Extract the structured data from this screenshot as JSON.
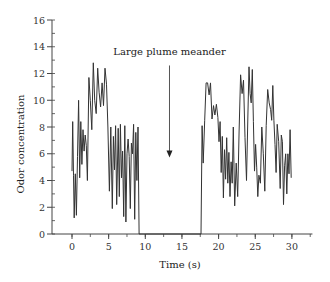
{
  "chart_data": {
    "type": "line",
    "title": "",
    "xlabel": "Time (s)",
    "ylabel": "Odor concentration",
    "xlim": [
      -2.8,
      32.8
    ],
    "ylim": [
      0,
      16
    ],
    "xticks": [
      0,
      5,
      10,
      15,
      20,
      25,
      30
    ],
    "xtick_labels": [
      "0",
      "5",
      "10",
      "15",
      "20",
      "25",
      "30"
    ],
    "x_minor_step": 2.5,
    "yticks": [
      0,
      2,
      4,
      6,
      8,
      10,
      12,
      14,
      16
    ],
    "ytick_labels": [
      "0",
      "2",
      "4",
      "6",
      "8",
      "10",
      "12",
      "14",
      "16"
    ],
    "y_minor_step": 1,
    "grid": false,
    "legend": null,
    "annotations": [
      {
        "text": "Large plume meander",
        "x": 13.3,
        "y": 13.5,
        "arrow_from": [
          13.3,
          12.6
        ],
        "arrow_to": [
          13.3,
          5.8
        ]
      }
    ],
    "series": [
      {
        "name": "Odor concentration",
        "color": "#333333",
        "x": [
          0.0,
          0.1,
          0.2,
          0.3,
          0.45,
          0.6,
          0.75,
          0.9,
          1.05,
          1.2,
          1.35,
          1.5,
          1.65,
          1.8,
          1.95,
          2.1,
          2.3,
          2.5,
          2.7,
          2.9,
          3.1,
          3.3,
          3.5,
          3.7,
          3.9,
          4.1,
          4.3,
          4.5,
          4.7,
          4.9,
          5.1,
          5.3,
          5.5,
          5.65,
          5.8,
          5.95,
          6.1,
          6.3,
          6.45,
          6.6,
          6.75,
          6.9,
          7.05,
          7.2,
          7.35,
          7.5,
          7.65,
          7.8,
          7.95,
          8.1,
          8.25,
          8.4,
          8.55,
          8.7,
          8.85,
          9.0,
          9.15,
          9.3,
          9.45,
          9.6,
          9.75,
          9.9,
          10.0,
          17.6,
          17.75,
          17.9,
          18.1,
          18.3,
          18.5,
          18.7,
          18.9,
          19.1,
          19.3,
          19.5,
          19.7,
          19.9,
          20.05,
          20.2,
          20.35,
          20.5,
          20.65,
          20.8,
          20.95,
          21.1,
          21.25,
          21.4,
          21.55,
          21.7,
          21.85,
          22.0,
          22.2,
          22.4,
          22.6,
          22.8,
          23.0,
          23.2,
          23.4,
          23.6,
          23.8,
          24.0,
          24.15,
          24.3,
          24.45,
          24.6,
          24.75,
          24.9,
          25.05,
          25.2,
          25.35,
          25.5,
          25.7,
          25.9,
          26.1,
          26.3,
          26.5,
          26.7,
          26.9,
          27.1,
          27.25,
          27.4,
          27.55,
          27.7,
          27.85,
          28.0,
          28.2,
          28.4,
          28.55,
          28.7,
          28.85,
          29.0,
          29.15,
          29.3,
          29.45,
          29.6,
          29.75,
          29.9
        ],
        "y": [
          4.7,
          8.4,
          4.4,
          1.2,
          4.5,
          1.4,
          5.8,
          10.0,
          4.2,
          8.4,
          5.2,
          7.8,
          6.2,
          7.4,
          6.6,
          4.0,
          11.7,
          10.0,
          7.8,
          12.8,
          10.0,
          9.0,
          12.4,
          10.6,
          9.5,
          11.3,
          9.6,
          12.4,
          11.2,
          8.0,
          3.2,
          8.0,
          1.9,
          7.3,
          4.8,
          8.1,
          2.2,
          7.9,
          2.8,
          8.2,
          4.2,
          6.2,
          1.3,
          8.1,
          0.9,
          6.0,
          7.1,
          5.8,
          1.9,
          6.8,
          6.0,
          8.2,
          1.1,
          7.6,
          4.0,
          8.0,
          0.0,
          0.0,
          0.0,
          0.0,
          0.0,
          0.0,
          0.0,
          0.0,
          8.1,
          5.3,
          8.5,
          11.3,
          11.3,
          10.4,
          11.3,
          8.6,
          9.6,
          8.9,
          9.7,
          8.7,
          6.9,
          8.4,
          4.6,
          7.3,
          2.7,
          6.3,
          4.1,
          7.2,
          3.8,
          6.1,
          2.8,
          5.4,
          3.8,
          8.0,
          2.1,
          5.3,
          2.8,
          7.7,
          11.9,
          10.5,
          11.5,
          7.2,
          4.0,
          8.9,
          12.5,
          10.5,
          9.8,
          12.3,
          8.4,
          4.7,
          6.7,
          5.0,
          2.8,
          4.4,
          3.8,
          8.0,
          6.0,
          3.2,
          8.1,
          10.8,
          9.8,
          9.3,
          8.5,
          11.1,
          8.5,
          6.7,
          4.6,
          8.2,
          6.9,
          3.4,
          7.4,
          6.9,
          2.2,
          5.1,
          6.0,
          3.0,
          6.0,
          4.5,
          7.8,
          4.2
        ]
      }
    ]
  }
}
